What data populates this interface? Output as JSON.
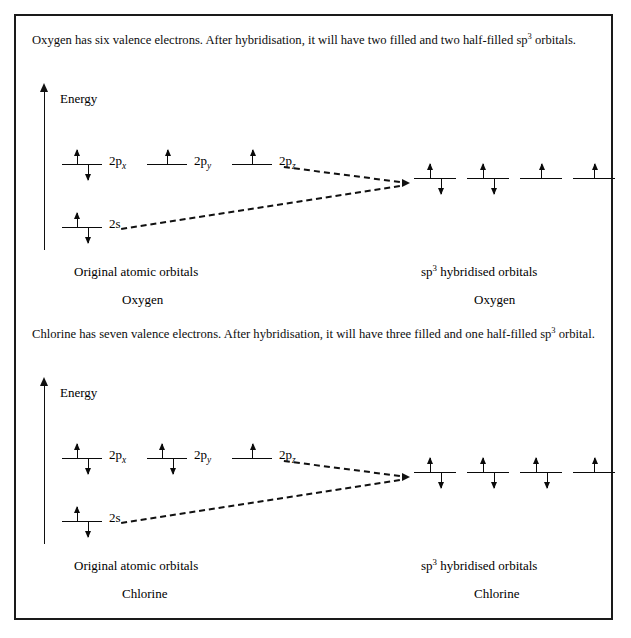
{
  "figure": {
    "border_color": "#1a1a1a",
    "background": "#ffffff",
    "ink_color": "#0a0a0a"
  },
  "sections": [
    {
      "id": "oxygen",
      "paragraph_prefix": "Oxygen has six valence electrons. After hybridisation, it will have two filled and two half-filled sp",
      "paragraph_sup": "3",
      "paragraph_suffix": " orbitals.",
      "energy_label": "Energy",
      "atomic_orbitals": [
        {
          "label_prefix": "2p",
          "label_sub": "x",
          "electrons": [
            "up",
            "down"
          ]
        },
        {
          "label_prefix": "2p",
          "label_sub": "y",
          "electrons": [
            "up"
          ]
        },
        {
          "label_prefix": "2p",
          "label_sub": "z",
          "electrons": [
            "up"
          ]
        }
      ],
      "s_orbital": {
        "label": "2s",
        "electrons": [
          "up",
          "down"
        ]
      },
      "hybrid_orbitals": [
        {
          "electrons": [
            "up",
            "down"
          ]
        },
        {
          "electrons": [
            "up",
            "down"
          ]
        },
        {
          "electrons": [
            "up"
          ]
        },
        {
          "electrons": [
            "up"
          ]
        }
      ],
      "caption_left": "Original atomic orbitals",
      "caption_left_sub": "Oxygen",
      "caption_right_prefix": "sp",
      "caption_right_sup": "3",
      "caption_right_suffix": " hybridised orbitals",
      "caption_right_sub": "Oxygen"
    },
    {
      "id": "chlorine",
      "paragraph_prefix": "Chlorine has seven valence electrons. After hybridisation, it will have three filled and one half-filled sp",
      "paragraph_sup": "3",
      "paragraph_suffix": " orbital.",
      "energy_label": "Energy",
      "atomic_orbitals": [
        {
          "label_prefix": "2p",
          "label_sub": "x",
          "electrons": [
            "up",
            "down"
          ]
        },
        {
          "label_prefix": "2p",
          "label_sub": "y",
          "electrons": [
            "up",
            "down"
          ]
        },
        {
          "label_prefix": "2p",
          "label_sub": "z",
          "electrons": [
            "up"
          ]
        }
      ],
      "s_orbital": {
        "label": "2s",
        "electrons": [
          "up",
          "down"
        ]
      },
      "hybrid_orbitals": [
        {
          "electrons": [
            "up",
            "down"
          ]
        },
        {
          "electrons": [
            "up",
            "down"
          ]
        },
        {
          "electrons": [
            "up",
            "down"
          ]
        },
        {
          "electrons": [
            "up"
          ]
        }
      ],
      "caption_left": "Original atomic orbitals",
      "caption_left_sub": "Chlorine",
      "caption_right_prefix": "sp",
      "caption_right_sup": "3",
      "caption_right_suffix": " hybridised orbitals",
      "caption_right_sub": "Chlorine"
    }
  ]
}
